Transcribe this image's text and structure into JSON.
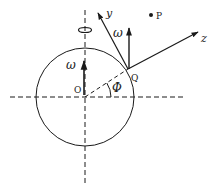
{
  "diagram": {
    "type": "rotating-sphere-coordinate-frame",
    "labels": {
      "y_axis": "y",
      "z_axis": "z",
      "omega_at_Q": "ω",
      "omega_at_O": "ω",
      "point_P": "P",
      "point_Q": "Q",
      "center_O": "O",
      "angle_phi": "Φ"
    },
    "colors": {
      "stroke": "#1a1a1a",
      "background": "#ffffff"
    }
  }
}
